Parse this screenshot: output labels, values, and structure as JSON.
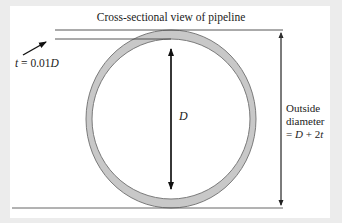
{
  "diagram": {
    "title": "Cross-sectional view of pipeline",
    "thickness_label": {
      "var": "t",
      "eq": " = 0.01",
      "unit_var": "D"
    },
    "inner_diameter_label": "D",
    "outside_diameter_label": {
      "line1": "Outside",
      "line2": "diameter",
      "line3_prefix": "= ",
      "line3_var1": "D",
      "line3_mid": " + 2",
      "line3_var2": "t"
    },
    "colors": {
      "background": "#ececec",
      "panel": "#ffffff",
      "pipe_wall": "#c8c8c8",
      "pipe_edge": "#7a7a7a",
      "lines": "#444444"
    }
  }
}
